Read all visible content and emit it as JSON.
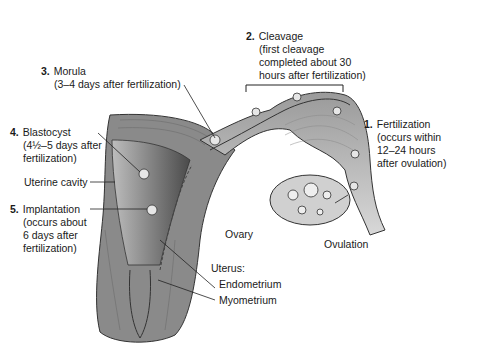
{
  "labels": {
    "step1": {
      "num": "1.",
      "title": "Fertilization",
      "lines": [
        "(occurs within",
        "12–24 hours",
        "after ovulation)"
      ]
    },
    "step2": {
      "num": "2.",
      "title": "Cleavage",
      "lines": [
        "(first cleavage",
        "completed about 30",
        "hours after fertilization)"
      ]
    },
    "step3": {
      "num": "3.",
      "title": "Morula",
      "lines": [
        "(3–4 days after fertilization)"
      ]
    },
    "step4": {
      "num": "4.",
      "title": "Blastocyst",
      "lines": [
        "(4½–5 days after",
        "fertilization)"
      ]
    },
    "step5": {
      "num": "5.",
      "title": "Implantation",
      "lines": [
        "(occurs about",
        "6 days after",
        "fertilization)"
      ]
    },
    "uterine_cavity": "Uterine cavity",
    "ovary": "Ovary",
    "ovulation": "Ovulation",
    "uterus": "Uterus:",
    "endometrium": "Endometrium",
    "myometrium": "Myometrium"
  },
  "colors": {
    "tissue_dark": "#5a5a5a",
    "tissue_mid": "#8c8c8c",
    "tissue_light": "#c8c8c8",
    "text": "#1a1a1a"
  }
}
